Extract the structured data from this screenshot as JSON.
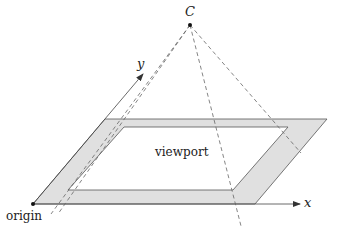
{
  "diagram": {
    "type": "viewport-projection",
    "labels": {
      "center": "C",
      "origin": "origin",
      "x_axis": "x",
      "y_axis": "y",
      "region": "viewport"
    },
    "colors": {
      "band_fill": "#e0e0e0",
      "stroke": "#555555",
      "dash": "#666666",
      "point": "#111111",
      "text": "#222222"
    },
    "points": {
      "C": [
        190,
        25
      ],
      "origin": [
        33,
        204
      ]
    },
    "outer_parallelogram": [
      [
        33,
        204
      ],
      [
        255,
        204
      ],
      [
        327,
        119
      ],
      [
        105,
        119
      ]
    ],
    "inner_parallelogram": [
      [
        68,
        190
      ],
      [
        233,
        190
      ],
      [
        288,
        127
      ],
      [
        124,
        127
      ]
    ],
    "axes": {
      "x": {
        "from": [
          33,
          204
        ],
        "to": [
          300,
          204
        ]
      },
      "y": {
        "from": [
          33,
          204
        ],
        "to": [
          143,
          74
        ]
      }
    },
    "projection_lines": [
      {
        "from": [
          190,
          25
        ],
        "to": [
          51,
          214
        ]
      },
      {
        "from": [
          190,
          25
        ],
        "to": [
          56,
          214
        ]
      },
      {
        "from": [
          190,
          25
        ],
        "to": [
          241,
          226
        ]
      },
      {
        "from": [
          190,
          25
        ],
        "to": [
          301,
          153
        ]
      }
    ]
  }
}
